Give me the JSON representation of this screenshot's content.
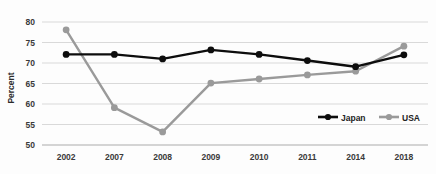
{
  "chart_data": {
    "type": "line",
    "title": "",
    "xlabel": "",
    "ylabel": "Percent",
    "categories": [
      "2002",
      "2007",
      "2008",
      "2009",
      "2010",
      "2011",
      "2014",
      "2018"
    ],
    "ylim": [
      50,
      80
    ],
    "yticks": [
      "50",
      "55",
      "60",
      "65",
      "70",
      "75",
      "80"
    ],
    "ytick_values": [
      50,
      55,
      60,
      65,
      70,
      75,
      80
    ],
    "grid": true,
    "legend_position": "inside-bottom-right",
    "series": [
      {
        "name": "Japan",
        "color": "#0d0d0d",
        "marker": "circle",
        "values": [
          72.1,
          72.1,
          71.0,
          73.2,
          72.1,
          70.6,
          69.1,
          72.0
        ]
      },
      {
        "name": "USA",
        "color": "#9a9a9a",
        "marker": "circle",
        "values": [
          78.1,
          59.1,
          53.2,
          65.1,
          66.1,
          67.1,
          68.0,
          74.1
        ]
      }
    ]
  },
  "legend": {
    "items": [
      {
        "label": "Japan",
        "color": "#0d0d0d"
      },
      {
        "label": "USA",
        "color": "#9a9a9a"
      }
    ]
  }
}
